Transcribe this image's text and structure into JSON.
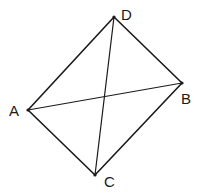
{
  "figure": {
    "type": "quadrilateral-with-diagonals",
    "vertices": [
      {
        "label": "A",
        "x": 28,
        "y": 110,
        "lx": 9,
        "ly": 116
      },
      {
        "label": "B",
        "x": 182,
        "y": 83,
        "lx": 181,
        "ly": 104
      },
      {
        "label": "C",
        "x": 95,
        "y": 175,
        "lx": 104,
        "ly": 187
      },
      {
        "label": "D",
        "x": 114,
        "y": 17,
        "lx": 121,
        "ly": 20
      }
    ],
    "sides": [
      [
        "A",
        "D"
      ],
      [
        "D",
        "B"
      ],
      [
        "B",
        "C"
      ],
      [
        "C",
        "A"
      ]
    ],
    "diagonals": [
      [
        "A",
        "B"
      ],
      [
        "D",
        "C"
      ]
    ],
    "stroke_color": "#1a1a1a"
  }
}
